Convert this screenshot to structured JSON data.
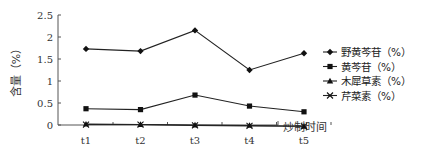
{
  "chart_data": {
    "type": "line",
    "title": "",
    "xlabel": "炒制时间",
    "ylabel": "含量（%）",
    "categories": [
      "t1",
      "t2",
      "t3",
      "t4",
      "t5"
    ],
    "ylim": [
      0,
      2.5
    ],
    "yticks": [
      "0",
      "0.5",
      "1",
      "1.5",
      "2",
      "2.5"
    ],
    "ytick_values": [
      0,
      0.5,
      1,
      1.5,
      2,
      2.5
    ],
    "grid": false,
    "legend_position": "right",
    "series": [
      {
        "name": "野黄芩苷（%）",
        "marker": "diamond",
        "values": [
          1.73,
          1.68,
          2.15,
          1.25,
          1.63
        ]
      },
      {
        "name": "黄芩苷（%）",
        "marker": "square",
        "values": [
          0.37,
          0.35,
          0.68,
          0.43,
          0.3
        ]
      },
      {
        "name": "木犀草素（%）",
        "marker": "triangle",
        "values": [
          0.02,
          0.01,
          0.0,
          -0.01,
          -0.03
        ]
      },
      {
        "name": "芹菜素（%）",
        "marker": "x",
        "values": [
          0.01,
          0.01,
          -0.01,
          -0.02,
          -0.03
        ]
      }
    ]
  }
}
